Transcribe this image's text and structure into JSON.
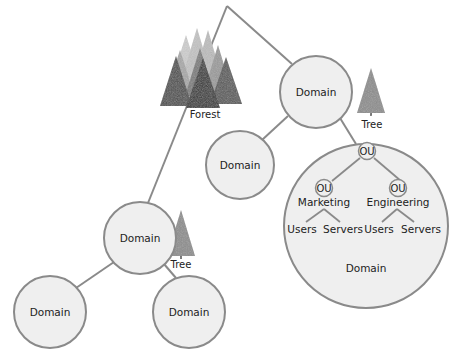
{
  "diagram": {
    "type": "active-directory-hierarchy",
    "colors": {
      "line": "#8a8a8a",
      "circle_fill": "#efefef",
      "circle_stroke": "#8a8a8a",
      "tree_fill": "#8c8c8c",
      "forest_dark": "#3f3f3f",
      "forest_light": "#c4c4c4",
      "text": "#222222"
    },
    "forest": {
      "label": "Forest"
    },
    "trees": [
      {
        "label": "Tree"
      },
      {
        "label": "Tree"
      }
    ],
    "domains": [
      {
        "id": "top",
        "label": "Domain"
      },
      {
        "id": "mid-left",
        "label": "Domain"
      },
      {
        "id": "lower-left",
        "label": "Domain"
      },
      {
        "id": "bottom-left",
        "label": "Domain"
      },
      {
        "id": "bottom-middle",
        "label": "Domain"
      },
      {
        "id": "large",
        "label": "Domain"
      }
    ],
    "ou_structure": {
      "root": {
        "label": "OU"
      },
      "children": [
        {
          "ou_label": "OU",
          "name": "Marketing",
          "leaves": [
            "Users",
            "Servers"
          ]
        },
        {
          "ou_label": "OU",
          "name": "Engineering",
          "leaves": [
            "Users",
            "Servers"
          ]
        }
      ]
    }
  }
}
